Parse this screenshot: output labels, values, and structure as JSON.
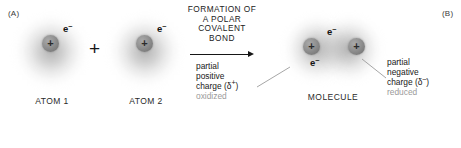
{
  "figure": {
    "panel_a_label": "(A)",
    "panel_b_label": "(B)"
  },
  "reactants": {
    "atom1": {
      "caption": "ATOM 1",
      "nucleus_charge": "+",
      "electron_label": "e",
      "electron_charge": "–"
    },
    "operator": "+",
    "atom2": {
      "caption": "ATOM 2",
      "nucleus_charge": "+",
      "electron_label": "e",
      "electron_charge": "–"
    }
  },
  "reaction": {
    "heading_lines": [
      "FORMATION OF",
      "A POLAR",
      "COVALENT",
      "BOND"
    ],
    "arrow": "arrow-right"
  },
  "product": {
    "caption": "MOLECULE",
    "left_nucleus_charge": "+",
    "right_nucleus_charge": "+",
    "electron_upper_label": "e",
    "electron_upper_charge": "–",
    "electron_lower_label": "e",
    "electron_lower_charge": "–"
  },
  "annotations": {
    "left": {
      "line1": "partial",
      "line2": "positive",
      "line3_prefix": "charge (δ",
      "line3_sup": "+",
      "line3_suffix": ")",
      "note": "oxidized"
    },
    "right": {
      "line1": "partial",
      "line2": "negative",
      "line3_prefix": "charge (δ",
      "line3_sup": "–",
      "line3_suffix": ")",
      "note": "reduced"
    }
  },
  "colors": {
    "nucleus": "#8a8a8a",
    "cloud": "#b4b4b4",
    "text": "#1a1a1a",
    "muted_text": "#9a9a9a",
    "leader_line": "#9c9c9c",
    "background": "#ffffff"
  }
}
